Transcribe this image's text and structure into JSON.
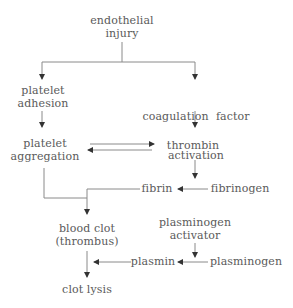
{
  "diagram": {
    "colors": {
      "text": "#5a5a5a",
      "line": "#8a8a8a",
      "arrowhead": "#333333",
      "background": "#ffffff"
    },
    "nodes": {
      "endothelial_injury": {
        "line1": "endothelial",
        "line2": "injury"
      },
      "platelet_adhesion": {
        "line1": "platelet",
        "line2": "adhesion"
      },
      "coagulation_factor_activation": {
        "line1": "coagulation  factor",
        "line2": "activation"
      },
      "platelet_aggregation": {
        "line1": "platelet",
        "line2": "aggregation"
      },
      "thrombin": {
        "line1": "thrombin"
      },
      "fibrin": {
        "line1": "fibrin"
      },
      "fibrinogen": {
        "line1": "fibrinogen"
      },
      "blood_clot": {
        "line1": "blood clot",
        "line2": "(thrombus)"
      },
      "plasminogen_activator": {
        "line1": "plasminogen",
        "line2": "activator"
      },
      "plasmin": {
        "line1": "plasmin"
      },
      "plasminogen": {
        "line1": "plasminogen"
      },
      "clot_lysis": {
        "line1": "clot lysis"
      }
    },
    "edges": [
      {
        "from": "endothelial injury",
        "to": "platelet adhesion"
      },
      {
        "from": "endothelial injury",
        "to": "coagulation factor activation"
      },
      {
        "from": "platelet adhesion",
        "to": "platelet aggregation"
      },
      {
        "from": "coagulation factor activation",
        "to": "thrombin"
      },
      {
        "from": "platelet aggregation",
        "to": "thrombin",
        "bidirectional": true
      },
      {
        "from": "thrombin",
        "to": "fibrin (via fibrinogen)"
      },
      {
        "from": "fibrinogen",
        "to": "fibrin"
      },
      {
        "from": "platelet aggregation",
        "to": "blood clot (thrombus)"
      },
      {
        "from": "fibrin",
        "to": "blood clot (thrombus)"
      },
      {
        "from": "plasminogen activator",
        "to": "plasmin (via plasminogen)"
      },
      {
        "from": "plasminogen",
        "to": "plasmin"
      },
      {
        "from": "plasmin",
        "to": "blood clot (thrombus) lysis"
      },
      {
        "from": "blood clot (thrombus)",
        "to": "clot lysis"
      }
    ]
  }
}
